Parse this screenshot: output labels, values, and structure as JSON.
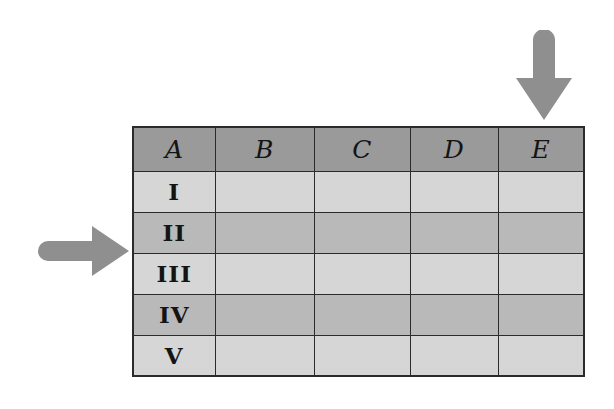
{
  "diagram": {
    "background_color": "#ffffff"
  },
  "colors": {
    "header_fill": "#9a9a9a",
    "row_light_fill": "#d6d6d6",
    "row_dark_fill": "#b9b9b9",
    "grid_line": "#2b2b2b",
    "arrow_fill": "#8f8f8f"
  },
  "table": {
    "corner_header": "A",
    "column_headers": [
      "A",
      "B",
      "C",
      "D",
      "E"
    ],
    "row_labels": [
      "I",
      "II",
      "III",
      "IV",
      "V"
    ],
    "rows": [
      {
        "label": "I",
        "shade": "light",
        "cells": [
          "",
          "",
          "",
          ""
        ]
      },
      {
        "label": "II",
        "shade": "dark",
        "cells": [
          "",
          "",
          "",
          ""
        ]
      },
      {
        "label": "III",
        "shade": "light",
        "cells": [
          "",
          "",
          "",
          ""
        ]
      },
      {
        "label": "IV",
        "shade": "dark",
        "cells": [
          "",
          "",
          "",
          ""
        ]
      },
      {
        "label": "V",
        "shade": "light",
        "cells": [
          "",
          "",
          "",
          ""
        ]
      }
    ]
  },
  "annotations": {
    "down_arrow": {
      "icon": "arrow-down-icon",
      "label": "",
      "points_to": "E",
      "direction": "down"
    },
    "right_arrow": {
      "icon": "arrow-right-icon",
      "label": "",
      "points_to": "II",
      "direction": "right"
    }
  }
}
